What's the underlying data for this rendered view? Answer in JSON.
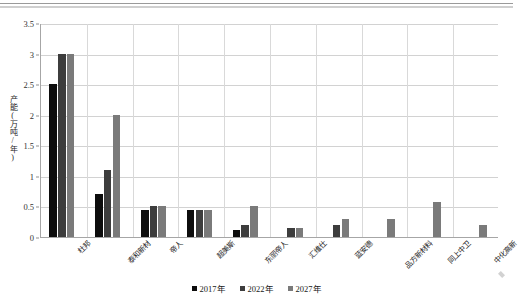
{
  "chart_data": {
    "type": "bar",
    "title": "",
    "xlabel": "",
    "ylabel": "产能(万吨/年)",
    "ylim": [
      0,
      3.5
    ],
    "yticks": [
      "0",
      "0.5",
      "1",
      "1.5",
      "2",
      "2.5",
      "3",
      "3.5"
    ],
    "ytick_values": [
      0,
      0.5,
      1,
      1.5,
      2,
      2.5,
      3,
      3.5
    ],
    "grid": true,
    "legend_position": "bottom",
    "categories": [
      "杜邦",
      "泰和新材",
      "帝人",
      "超美斯",
      "东丽帝人",
      "汇维仕",
      "蓝安德",
      "品方新材料",
      "同上中卫",
      "中化高新"
    ],
    "series": [
      {
        "name": "2017年",
        "color": "#0d0d0d",
        "values": [
          2.5,
          0.7,
          0.45,
          0.45,
          0.12,
          0,
          0,
          0,
          0,
          0
        ]
      },
      {
        "name": "2022年",
        "color": "#3d3d3d",
        "values": [
          3.0,
          1.1,
          0.5,
          0.45,
          0.2,
          0.15,
          0.2,
          0,
          0,
          0
        ]
      },
      {
        "name": "2027年",
        "color": "#7a7a7a",
        "values": [
          3.0,
          2.0,
          0.5,
          0.45,
          0.5,
          0.15,
          0.3,
          0.3,
          0.58,
          0.2
        ]
      }
    ]
  }
}
